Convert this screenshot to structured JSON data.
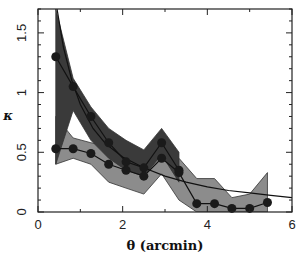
{
  "chart_data": {
    "type": "line",
    "title": "",
    "xlabel": "θ (arcmin)",
    "ylabel": "κ",
    "xlim": [
      0,
      6
    ],
    "ylim": [
      0,
      1.7
    ],
    "xticks": [
      0,
      2,
      4,
      6
    ],
    "xtick_labels": [
      "0",
      "2",
      "4",
      "6"
    ],
    "yticks": [
      0,
      0.5,
      1,
      1.5
    ],
    "ytick_labels": [
      "0",
      "0.5",
      "1",
      "1.5"
    ],
    "grid": false,
    "legend": null,
    "series": [
      {
        "name": "upper profile",
        "style": "markers+line",
        "x": [
          0.42,
          0.83,
          1.25,
          1.67,
          2.08,
          2.5,
          2.92,
          3.33
        ],
        "y": [
          1.3,
          1.05,
          0.8,
          0.58,
          0.42,
          0.37,
          0.58,
          0.35
        ],
        "band_upper": [
          1.7,
          1.12,
          0.88,
          0.7,
          0.6,
          0.52,
          0.7,
          0.5
        ],
        "band_lower": [
          0.4,
          0.85,
          0.6,
          0.45,
          0.35,
          0.3,
          0.48,
          0.25
        ]
      },
      {
        "name": "lower profile",
        "style": "markers+line",
        "x": [
          0.42,
          0.83,
          1.25,
          1.67,
          2.08,
          2.5,
          2.92,
          3.33,
          3.75,
          4.17,
          4.58,
          5.0,
          5.42
        ],
        "y": [
          0.53,
          0.53,
          0.49,
          0.4,
          0.35,
          0.3,
          0.45,
          0.33,
          0.07,
          0.07,
          0.03,
          0.03,
          0.08
        ],
        "band_upper": [
          0.8,
          0.62,
          0.58,
          0.55,
          0.45,
          0.4,
          0.55,
          0.45,
          0.28,
          0.28,
          0.12,
          0.15,
          0.33
        ],
        "band_lower": [
          0.4,
          0.45,
          0.4,
          0.25,
          0.2,
          0.15,
          0.32,
          0.1,
          0.0,
          0.0,
          0.0,
          0.0,
          0.0
        ]
      },
      {
        "name": "model curve",
        "style": "line",
        "x": [
          0.45,
          0.6,
          0.8,
          1.0,
          1.3,
          1.6,
          2.0,
          2.5,
          3.0,
          3.5,
          4.0,
          4.5,
          5.0,
          5.5,
          6.0
        ],
        "y": [
          1.7,
          1.38,
          1.1,
          0.9,
          0.7,
          0.57,
          0.46,
          0.37,
          0.3,
          0.25,
          0.21,
          0.18,
          0.16,
          0.14,
          0.12
        ]
      }
    ]
  }
}
